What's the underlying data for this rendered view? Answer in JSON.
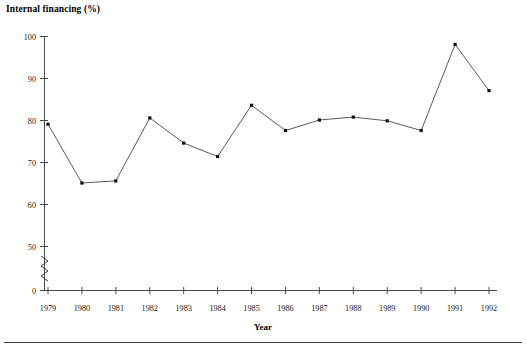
{
  "chart_data": {
    "type": "line",
    "title": "Internal financing (%)",
    "xlabel": "Year",
    "ylabel": "",
    "categories": [
      "1979",
      "1980",
      "1981",
      "1982",
      "1983",
      "1984",
      "1985",
      "1986",
      "1987",
      "1988",
      "1989",
      "1990",
      "1991",
      "1992"
    ],
    "values": [
      79.0,
      65.0,
      65.5,
      80.5,
      74.5,
      71.3,
      83.5,
      77.5,
      80.0,
      80.7,
      79.8,
      77.5,
      98.0,
      87.0
    ],
    "series": [
      {
        "name": "Internal financing (%)",
        "values": [
          79.0,
          65.0,
          65.5,
          80.5,
          74.5,
          71.3,
          83.5,
          77.5,
          80.0,
          80.7,
          79.8,
          77.5,
          98.0,
          87.0
        ]
      }
    ],
    "ylim": [
      50,
      100
    ],
    "ytick_labels": [
      "0",
      "50",
      "60",
      "70",
      "80",
      "90",
      "100"
    ],
    "yticks": [
      0,
      50,
      60,
      70,
      80,
      90,
      100
    ],
    "xtick_labels": [
      "1979",
      "1980",
      "1981",
      "1982",
      "1983",
      "1984",
      "1985",
      "1986",
      "1987",
      "1988",
      "1989",
      "1990",
      "1991",
      "1992"
    ],
    "axis_break": true,
    "axis_break_between": [
      0,
      50
    ],
    "grid": false,
    "legend": false,
    "legend_position": "none",
    "marker": "square",
    "line_color": "#5a5a5a",
    "marker_color": "#111111",
    "axis_color": "#4a4a4a"
  },
  "figure": {
    "title": "Internal financing (%)",
    "xaxis_title": "Year"
  }
}
